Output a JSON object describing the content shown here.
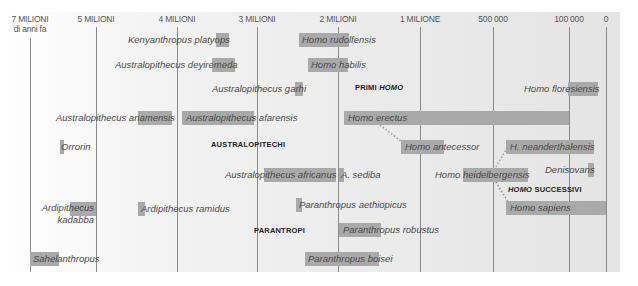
{
  "chart_data": {
    "type": "timeline",
    "title": "",
    "xlabel": "Millions of years ago",
    "axis": {
      "ticks": [
        {
          "label": "7 MILIONI",
          "sub": "di anni fa",
          "value_ya": 7000000,
          "x": 30
        },
        {
          "label": "5 MILIONI",
          "value_ya": 5000000,
          "x": 96
        },
        {
          "label": "4 MILIONI",
          "value_ya": 4000000,
          "x": 177
        },
        {
          "label": "3 MILIONI",
          "value_ya": 3000000,
          "x": 257
        },
        {
          "label": "2 MILIONI",
          "value_ya": 2000000,
          "x": 338
        },
        {
          "label": "1 MILIONE",
          "value_ya": 1000000,
          "x": 420
        },
        {
          "label": "500 000",
          "value_ya": 500000,
          "x": 493
        },
        {
          "label": "100 000",
          "value_ya": 100000,
          "x": 569
        },
        {
          "label": "0",
          "value_ya": 0,
          "x": 606
        }
      ]
    },
    "groups": [
      {
        "label": "PRIMI ",
        "label_italic": "HOMO",
        "x": 355,
        "y": 83
      },
      {
        "label": "AUSTRALOPITECHI",
        "label_italic": "",
        "x": 211,
        "y": 140
      },
      {
        "label": "",
        "label_italic": "HOMO",
        "label_tail": " SUCCESSIVI",
        "x": 508,
        "y": 185
      },
      {
        "label": "PARANTROPI",
        "label_italic": "",
        "x": 254,
        "y": 226
      }
    ],
    "species": [
      {
        "name": "Kenyanthropus platyops",
        "bar_x": 216,
        "bar_w": 13,
        "label_x": 128,
        "y": 33,
        "start_ma": 3.5,
        "end_ma": 3.3
      },
      {
        "name": "Homo rudolfensis",
        "bar_x": 299,
        "bar_w": 50,
        "label_x": 302,
        "y": 33,
        "start_ma": 2.4,
        "end_ma": 1.8
      },
      {
        "name": "Australopithecus deyiremeda",
        "bar_x": 212,
        "bar_w": 23,
        "label_x": 115,
        "y": 58,
        "start_ma": 3.5,
        "end_ma": 3.3
      },
      {
        "name": "Homo habilis",
        "bar_x": 308,
        "bar_w": 40,
        "label_x": 311,
        "y": 58,
        "start_ma": 2.3,
        "end_ma": 1.5
      },
      {
        "name": "Australopithecus garhi",
        "bar_x": 295,
        "bar_w": 8,
        "label_x": 212,
        "y": 82,
        "start_ma": 2.5,
        "end_ma": 2.5
      },
      {
        "name": "Homo floresiensis",
        "bar_x": 568,
        "bar_w": 30,
        "label_x": 524,
        "y": 82,
        "start_ma": 0.1,
        "end_ma": 0.05
      },
      {
        "name": "Australopithecus anamensis",
        "bar_x": 138,
        "bar_w": 34,
        "label_x": 56,
        "y": 111,
        "start_ma": 4.2,
        "end_ma": 3.8
      },
      {
        "name": "Australopithecus afarensis",
        "bar_x": 182,
        "bar_w": 72,
        "label_x": 186,
        "y": 111,
        "start_ma": 3.9,
        "end_ma": 2.9
      },
      {
        "name": "Homo erectus",
        "bar_x": 344,
        "bar_w": 225,
        "label_x": 348,
        "y": 111,
        "start_ma": 1.9,
        "end_ma": 0.1
      },
      {
        "name": "Orrorin",
        "bar_x": 60,
        "bar_w": 4,
        "label_x": 61,
        "y": 140,
        "start_ma": 6.0,
        "end_ma": 6.0
      },
      {
        "name": "Homo antecessor",
        "bar_x": 401,
        "bar_w": 43,
        "label_x": 405,
        "y": 140,
        "start_ma": 1.2,
        "end_ma": 0.8
      },
      {
        "name": "H. neanderthalensis",
        "bar_x": 506,
        "bar_w": 88,
        "label_x": 510,
        "y": 140,
        "start_ma": 0.4,
        "end_ma": 0.04
      },
      {
        "name": "Australopithecus africanus",
        "bar_x": 264,
        "bar_w": 72,
        "label_x": 225,
        "y": 168,
        "start_ma": 3.0,
        "end_ma": 2.1
      },
      {
        "name": "A. sediba",
        "bar_x": 339,
        "bar_w": 5,
        "label_x": 341,
        "y": 168,
        "start_ma": 2.0,
        "end_ma": 1.95
      },
      {
        "name": "Homo heidelbergensis",
        "bar_x": 463,
        "bar_w": 65,
        "label_x": 435,
        "y": 168,
        "start_ma": 0.7,
        "end_ma": 0.2
      },
      {
        "name": "Denisovans",
        "bar_x": 588,
        "bar_w": 6,
        "label_x": 545,
        "y": 163,
        "start_ma": 0.05,
        "end_ma": 0.03
      },
      {
        "name": "Ardipithecus kadabba",
        "bar_x": 70,
        "bar_w": 26,
        "label_x": 40,
        "y": 202,
        "start_ma": 5.8,
        "end_ma": 5.2
      },
      {
        "name": "Ardipithecus ramidus",
        "bar_x": 138,
        "bar_w": 7,
        "label_x": 141,
        "y": 202,
        "start_ma": 4.4,
        "end_ma": 4.4
      },
      {
        "name": "Paranthropus aethiopicus",
        "bar_x": 296,
        "bar_w": 6,
        "label_x": 299,
        "y": 198,
        "start_ma": 2.7,
        "end_ma": 2.3
      },
      {
        "name": "Homo sapiens",
        "bar_x": 506,
        "bar_w": 100,
        "label_x": 510,
        "y": 201,
        "start_ma": 0.2,
        "end_ma": 0
      },
      {
        "name": "Paranthropus robustus",
        "bar_x": 339,
        "bar_w": 42,
        "label_x": 343,
        "y": 223,
        "start_ma": 2.0,
        "end_ma": 1.2
      },
      {
        "name": "Sahelanthropus",
        "bar_x": 30,
        "bar_w": 29,
        "label_x": 33,
        "y": 252,
        "start_ma": 7.0,
        "end_ma": 6.6
      },
      {
        "name": "Paranthropus boisei",
        "bar_x": 305,
        "bar_w": 74,
        "label_x": 308,
        "y": 252,
        "start_ma": 2.3,
        "end_ma": 1.2
      }
    ],
    "connectors": [
      {
        "from": "Homo erectus",
        "to": "Homo antecessor"
      },
      {
        "from": "Homo heidelbergensis",
        "to": "H. neanderthalensis"
      },
      {
        "from": "Homo heidelbergensis",
        "to": "Homo sapiens"
      }
    ],
    "grid": true
  }
}
